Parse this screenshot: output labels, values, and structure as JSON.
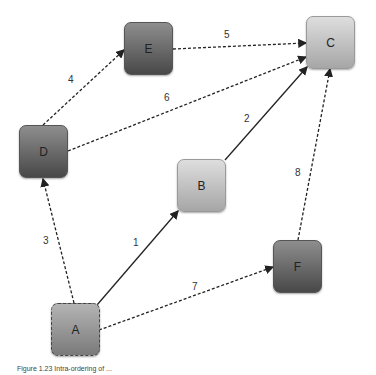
{
  "nodes": {
    "A": {
      "label": "A"
    },
    "B": {
      "label": "B"
    },
    "C": {
      "label": "C"
    },
    "D": {
      "label": "D"
    },
    "E": {
      "label": "E"
    },
    "F": {
      "label": "F"
    }
  },
  "edges": [
    {
      "from": "A",
      "to": "B",
      "label": "1",
      "style": "solid"
    },
    {
      "from": "B",
      "to": "C",
      "label": "2",
      "style": "solid"
    },
    {
      "from": "A",
      "to": "D",
      "label": "3",
      "style": "dashed"
    },
    {
      "from": "D",
      "to": "E",
      "label": "4",
      "style": "dashed"
    },
    {
      "from": "E",
      "to": "C",
      "label": "5",
      "style": "dashed"
    },
    {
      "from": "D",
      "to": "C",
      "label": "6",
      "style": "dashed"
    },
    {
      "from": "A",
      "to": "F",
      "label": "7",
      "style": "dashed"
    },
    {
      "from": "F",
      "to": "C",
      "label": "8",
      "style": "dashed"
    }
  ],
  "caption": "Figure 1.23 Intra-ordering of ..."
}
